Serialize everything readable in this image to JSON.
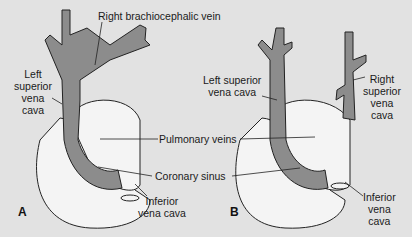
{
  "figure": {
    "panels": [
      {
        "letter": "A",
        "labels": {
          "left_svc": [
            "Left",
            "superior",
            "vena",
            "cava"
          ],
          "ivc": [
            "Inferior",
            "vena cava"
          ]
        }
      },
      {
        "letter": "B",
        "labels": {
          "left_svc": [
            "Left superior",
            "vena cava"
          ],
          "right_svc": [
            "Right",
            "superior",
            "vena",
            "cava"
          ],
          "ivc": [
            "Inferior",
            "vena",
            "cava"
          ]
        }
      }
    ],
    "shared_labels": {
      "right_brachiocephalic": "Right brachiocephalic vein",
      "pulmonary_veins": "Pulmonary veins",
      "coronary_sinus": "Coronary sinus"
    },
    "colors": {
      "background": "#e2e2e2",
      "vessel": "#8c8c8c",
      "heart": "#f4f4f4",
      "outline": "#222222"
    }
  }
}
